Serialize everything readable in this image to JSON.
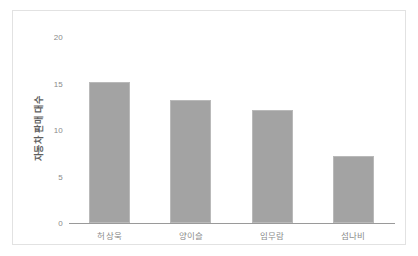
{
  "chart_data": {
    "type": "bar",
    "title": "",
    "subtitle": "",
    "xlabel": "",
    "ylabel": "자동차 판매 대수",
    "categories": [
      "허상욱",
      "양이슬",
      "임무람",
      "섬나비"
    ],
    "values": [
      15.2,
      13.2,
      12.2,
      7.2
    ],
    "ylim": [
      0,
      20
    ],
    "ytick_labels": [
      "0",
      "5",
      "10",
      "15",
      "20"
    ],
    "ytick_values": [
      0,
      5,
      10,
      15,
      20
    ],
    "grid": false,
    "legend": false,
    "legend_position": "none",
    "bar_color": "#a3a3a3",
    "bar_edge_color": "#b9b9b9",
    "axis_color": "#9a9a9a",
    "tick_label_color": "#8a8a8a",
    "axis_title_color": "#5e5e5e",
    "background_color": "#ffffff",
    "border_color": "#e2e2e2"
  }
}
